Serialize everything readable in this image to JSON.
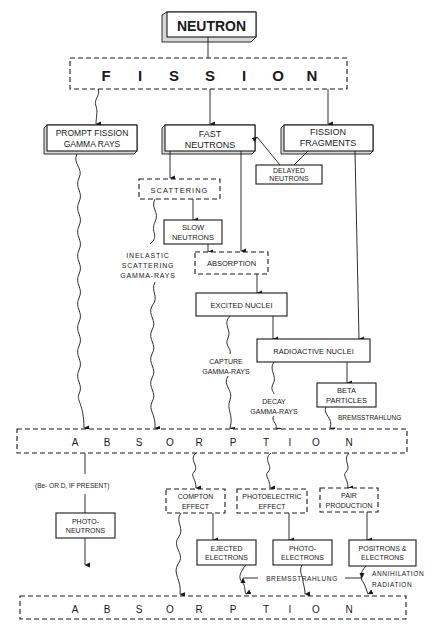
{
  "diagram": {
    "nodes": {
      "neutron": "NEUTRON",
      "fission": [
        "F",
        "I",
        "S",
        "S",
        "I",
        "O",
        "N"
      ],
      "prompt_fission_gamma": [
        "PROMPT FISSION",
        "GAMMA RAYS"
      ],
      "fast_neutrons": [
        "FAST",
        "NEUTRONS"
      ],
      "fission_fragments": [
        "FISSION",
        "FRAGMENTS"
      ],
      "delayed_neutrons": [
        "DELAYED",
        "NEUTRONS"
      ],
      "scattering": "SCATTERING",
      "slow_neutrons": [
        "SLOW",
        "NEUTRONS"
      ],
      "absorption_small": "ABSORPTION",
      "excited_nuclei": "EXCITED  NUCLEI",
      "radioactive_nuclei": "RADIOACTIVE NUCLEI",
      "beta_particles": [
        "BETA",
        "PARTICLES"
      ],
      "absorption_1": [
        "A",
        "B",
        "S",
        "O",
        "R",
        "P",
        "T",
        "I",
        "O",
        "N"
      ],
      "photo_neutrons": [
        "PHOTO-",
        "NEUTRONS"
      ],
      "compton_effect": [
        "COMPTON",
        "EFFECT"
      ],
      "photoelectric_effect": [
        "PHOTOELECTRIC",
        "EFFECT"
      ],
      "pair_production": [
        "PAIR",
        "PRODUCTION"
      ],
      "ejected_electrons": [
        "EJECTED",
        "ELECTRONS"
      ],
      "photo_electrons": [
        "PHOTO-",
        "ELECTRONS"
      ],
      "positrons_electrons": [
        "POSITRONS &",
        "ELECTRONS"
      ],
      "absorption_2": [
        "A",
        "B",
        "S",
        "O",
        "R",
        "P",
        "T",
        "I",
        "O",
        "N"
      ]
    },
    "labels": {
      "inelastic": [
        "INELASTIC",
        "SCATTERING",
        "GAMMA-RAYS"
      ],
      "capture": [
        "CAPTURE",
        "GAMMA-RAYS"
      ],
      "decay": [
        "DECAY",
        "GAMMA-RAYS"
      ],
      "bremsstrahlung_1": "BREMSSTRAHLUNG",
      "be_or_d": "(Be- OR D, IF PRESENT)",
      "bremsstrahlung_2": "BREMSSTRAHLUNG",
      "annihilation": [
        "ANNIHILATION",
        "RADIATION"
      ]
    }
  }
}
